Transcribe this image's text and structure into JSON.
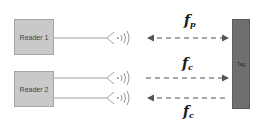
{
  "diagram": {
    "readers": [
      {
        "label": "Reader 1"
      },
      {
        "label": "Reader 2"
      }
    ],
    "tag": {
      "label": "Tag"
    },
    "links": [
      {
        "label_main": "f",
        "label_sub": "p",
        "direction": "bidirectional",
        "from": "Reader 1",
        "to": "Tag"
      },
      {
        "label_main": "f",
        "label_sub": "c",
        "direction": "reader-to-tag",
        "from": "Reader 2",
        "to": "Tag"
      },
      {
        "label_main": "f",
        "label_sub": "c",
        "direction": "tag-to-reader",
        "from": "Tag",
        "to": "Reader 2"
      }
    ],
    "colors": {
      "reader_fill": "#c9c9c9",
      "tag_fill": "#6f6f6f",
      "line": "#9a9a9a",
      "arrow": "#555555"
    }
  }
}
